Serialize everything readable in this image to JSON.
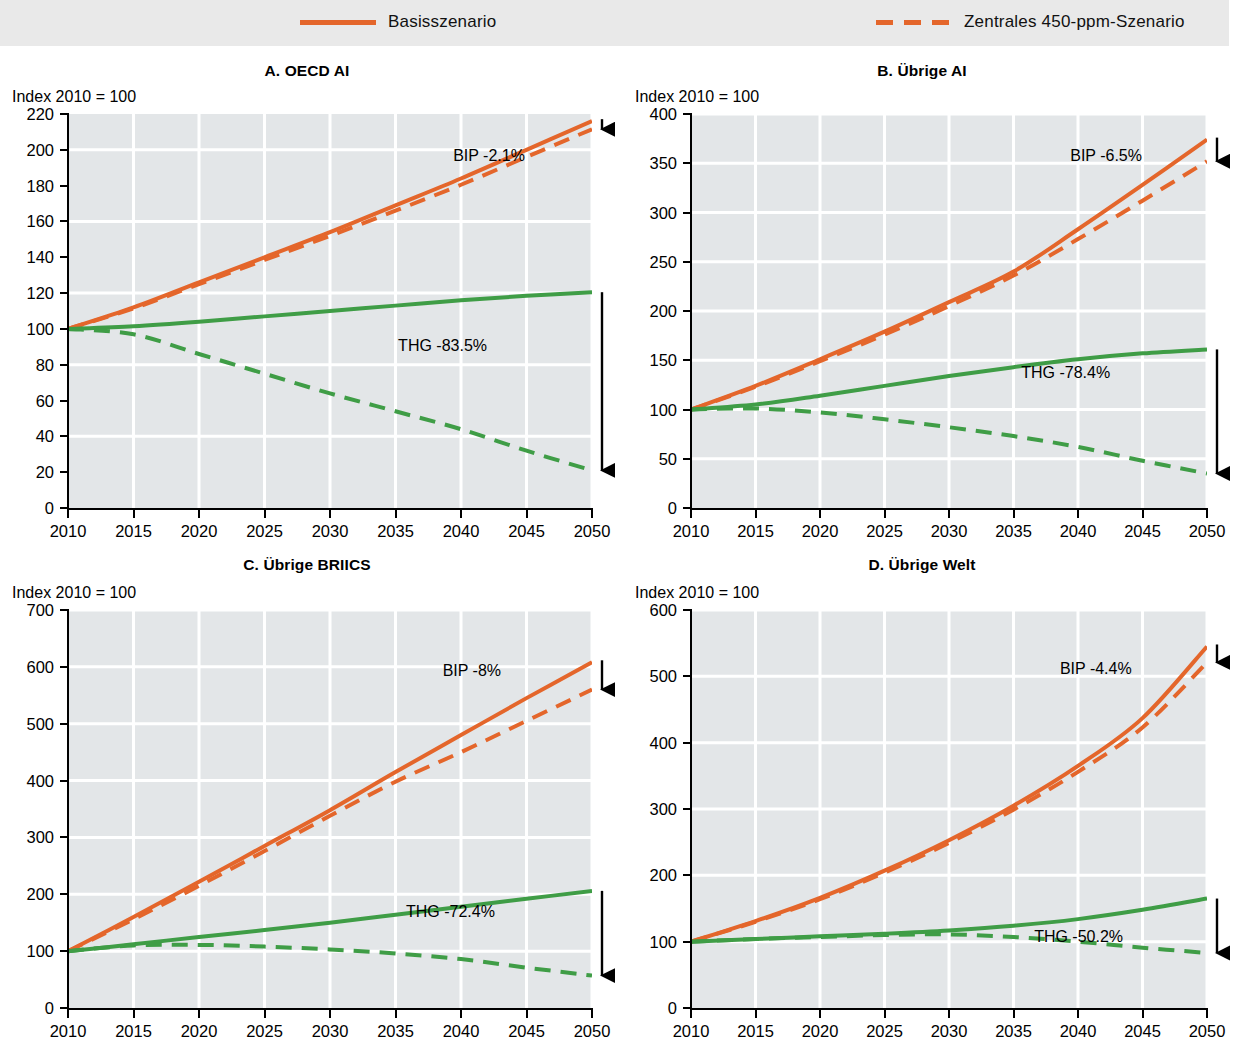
{
  "legend": {
    "items": [
      {
        "label": "Basisszenario",
        "style": "solid",
        "color": "#e4662b",
        "icon": "line-solid-icon"
      },
      {
        "label": "Zentrales 450-ppm-Szenario",
        "style": "dashed",
        "color": "#e4662b",
        "icon": "line-dashed-icon"
      }
    ]
  },
  "colors": {
    "gdp": "#e4662b",
    "ghg": "#3f9d46",
    "plot_background": "#e3e6e8",
    "gridline": "#ffffff",
    "axis": "#000000",
    "legend_band": "#e9e9e9"
  },
  "common": {
    "index_label": "Index 2010 = 100",
    "xticks": [
      2010,
      2015,
      2020,
      2025,
      2030,
      2035,
      2040,
      2045,
      2050
    ],
    "xlim": [
      2010,
      2050
    ]
  },
  "chart_data": [
    {
      "type": "line",
      "panel": "A",
      "title": "A. OECD AI",
      "xlabel": "",
      "ylabel": "Index 2010 = 100",
      "ylim": [
        0,
        220
      ],
      "yticks": [
        0,
        20,
        40,
        60,
        80,
        100,
        120,
        140,
        160,
        180,
        200,
        220
      ],
      "x": [
        2010,
        2015,
        2020,
        2025,
        2030,
        2035,
        2040,
        2045,
        2050
      ],
      "series": [
        {
          "name": "BIP Basisszenario",
          "color": "#e4662b",
          "style": "solid",
          "values": [
            100,
            112,
            126,
            140,
            154,
            169,
            184,
            200,
            216
          ]
        },
        {
          "name": "BIP Zentrales 450-ppm-Szenario",
          "color": "#e4662b",
          "style": "dashed",
          "values": [
            100,
            111.5,
            125,
            138.5,
            152,
            166,
            180.5,
            196,
            211.5
          ]
        },
        {
          "name": "THG Basisszenario",
          "color": "#3f9d46",
          "style": "solid",
          "values": [
            100,
            101.5,
            104,
            107,
            110,
            113,
            116,
            118.5,
            120.5
          ]
        },
        {
          "name": "THG Zentrales 450-ppm-Szenario",
          "color": "#3f9d46",
          "style": "dashed",
          "values": [
            100,
            97,
            86,
            75,
            64,
            54,
            44,
            32,
            21
          ]
        }
      ],
      "annotations": [
        {
          "text": "BIP -2.1%",
          "kind": "gdp-gap"
        },
        {
          "text": "THG -83.5%",
          "kind": "ghg-gap"
        }
      ]
    },
    {
      "type": "line",
      "panel": "B",
      "title": "B. Übrige AI",
      "xlabel": "",
      "ylabel": "Index 2010 = 100",
      "ylim": [
        0,
        400
      ],
      "yticks": [
        0,
        50,
        100,
        150,
        200,
        250,
        300,
        350,
        400
      ],
      "x": [
        2010,
        2015,
        2020,
        2025,
        2030,
        2035,
        2040,
        2045,
        2050
      ],
      "series": [
        {
          "name": "BIP Basisszenario",
          "color": "#e4662b",
          "style": "solid",
          "values": [
            100,
            124,
            151,
            179,
            209,
            240,
            283,
            328,
            374
          ]
        },
        {
          "name": "BIP Zentrales 450-ppm-Szenario",
          "color": "#e4662b",
          "style": "dashed",
          "values": [
            100,
            123,
            149,
            176,
            205,
            236,
            273,
            312,
            352
          ]
        },
        {
          "name": "THG Basisszenario",
          "color": "#3f9d46",
          "style": "solid",
          "values": [
            100,
            105,
            114,
            124,
            134,
            143,
            151,
            157,
            161
          ]
        },
        {
          "name": "THG Zentrales 450-ppm-Szenario",
          "color": "#3f9d46",
          "style": "dashed",
          "values": [
            100,
            101,
            97,
            90,
            82,
            73,
            62,
            48,
            35
          ]
        }
      ],
      "annotations": [
        {
          "text": "BIP -6.5%",
          "kind": "gdp-gap"
        },
        {
          "text": "THG -78.4%",
          "kind": "ghg-gap"
        }
      ]
    },
    {
      "type": "line",
      "panel": "C",
      "title": "C. Übrige BRIICS",
      "xlabel": "",
      "ylabel": "Index 2010 = 100",
      "ylim": [
        0,
        700
      ],
      "yticks": [
        0,
        100,
        200,
        300,
        400,
        500,
        600,
        700
      ],
      "x": [
        2010,
        2015,
        2020,
        2025,
        2030,
        2035,
        2040,
        2045,
        2050
      ],
      "series": [
        {
          "name": "BIP Basisszenario",
          "color": "#e4662b",
          "style": "solid",
          "values": [
            100,
            160,
            222,
            285,
            348,
            415,
            480,
            545,
            608
          ]
        },
        {
          "name": "BIP Zentrales 450-ppm-Szenario",
          "color": "#e4662b",
          "style": "dashed",
          "values": [
            100,
            156,
            215,
            276,
            338,
            398,
            450,
            505,
            560
          ]
        },
        {
          "name": "THG Basisszenario",
          "color": "#3f9d46",
          "style": "solid",
          "values": [
            100,
            112,
            125,
            137,
            150,
            164,
            178,
            192,
            206
          ]
        },
        {
          "name": "THG Zentrales 450-ppm-Szenario",
          "color": "#3f9d46",
          "style": "dashed",
          "values": [
            100,
            110,
            111,
            108,
            103,
            96,
            86,
            71,
            57
          ]
        }
      ],
      "annotations": [
        {
          "text": "BIP -8%",
          "kind": "gdp-gap"
        },
        {
          "text": "THG -72.4%",
          "kind": "ghg-gap"
        }
      ]
    },
    {
      "type": "line",
      "panel": "D",
      "title": "D. Übrige Welt",
      "xlabel": "",
      "ylabel": "Index 2010 = 100",
      "ylim": [
        0,
        600
      ],
      "yticks": [
        0,
        100,
        200,
        300,
        400,
        500,
        600
      ],
      "x": [
        2010,
        2015,
        2020,
        2025,
        2030,
        2035,
        2040,
        2045,
        2050
      ],
      "series": [
        {
          "name": "BIP Basisszenario",
          "color": "#e4662b",
          "style": "solid",
          "values": [
            100,
            131,
            166,
            207,
            253,
            305,
            365,
            437,
            545
          ]
        },
        {
          "name": "BIP Zentrales 450-ppm-Szenario",
          "color": "#e4662b",
          "style": "dashed",
          "values": [
            100,
            130,
            164,
            204,
            249,
            299,
            356,
            423,
            521
          ]
        },
        {
          "name": "THG Basisszenario",
          "color": "#3f9d46",
          "style": "solid",
          "values": [
            100,
            104,
            108,
            112,
            117,
            124,
            134,
            148,
            165
          ]
        },
        {
          "name": "THG Zentrales 450-ppm-Szenario",
          "color": "#3f9d46",
          "style": "dashed",
          "values": [
            100,
            104,
            107,
            110,
            111,
            107,
            100,
            91,
            83
          ]
        }
      ],
      "annotations": [
        {
          "text": "BIP -4.4%",
          "kind": "gdp-gap"
        },
        {
          "text": "THG -50.2%",
          "kind": "ghg-gap"
        }
      ]
    }
  ],
  "annotation_positions": {
    "A": {
      "bip": {
        "x": 0.735,
        "y": 0.085
      },
      "thg": {
        "x": 0.63,
        "y": 0.565
      }
    },
    "B": {
      "bip": {
        "x": 0.735,
        "y": 0.085
      },
      "thg": {
        "x": 0.64,
        "y": 0.635
      }
    },
    "C": {
      "bip": {
        "x": 0.715,
        "y": 0.13
      },
      "thg": {
        "x": 0.645,
        "y": 0.735
      }
    },
    "D": {
      "bip": {
        "x": 0.715,
        "y": 0.125
      },
      "thg": {
        "x": 0.665,
        "y": 0.8
      }
    }
  }
}
